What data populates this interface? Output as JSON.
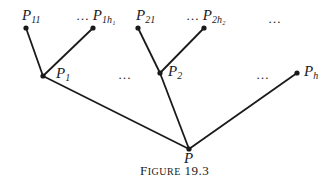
{
  "diagram": {
    "type": "tree",
    "nodes": [
      {
        "id": "P11",
        "label": "P",
        "sub": "11"
      },
      {
        "id": "P1h1",
        "label": "P",
        "sub": "1h₁",
        "prefix": "…"
      },
      {
        "id": "P21",
        "label": "P",
        "sub": "21"
      },
      {
        "id": "P2h2",
        "label": "P",
        "sub": "2h₂",
        "prefix": "…"
      },
      {
        "id": "P1",
        "label": "P",
        "sub": "1"
      },
      {
        "id": "P2",
        "label": "P",
        "sub": "2"
      },
      {
        "id": "Ph",
        "label": "P",
        "sub": "h"
      },
      {
        "id": "P",
        "label": "P",
        "sub": ""
      }
    ],
    "edges": [
      [
        "P11",
        "P1"
      ],
      [
        "P1h1",
        "P1"
      ],
      [
        "P21",
        "P2"
      ],
      [
        "P2h2",
        "P2"
      ],
      [
        "P1",
        "P"
      ],
      [
        "P2",
        "P"
      ],
      [
        "Ph",
        "P"
      ]
    ],
    "ellipses": {
      "top_right": "…",
      "mid_between_1_2": "…",
      "mid_before_h": "…",
      "prefix": "…"
    }
  },
  "caption": {
    "first_letter": "F",
    "rest": "IGURE",
    "number": "19.3"
  }
}
